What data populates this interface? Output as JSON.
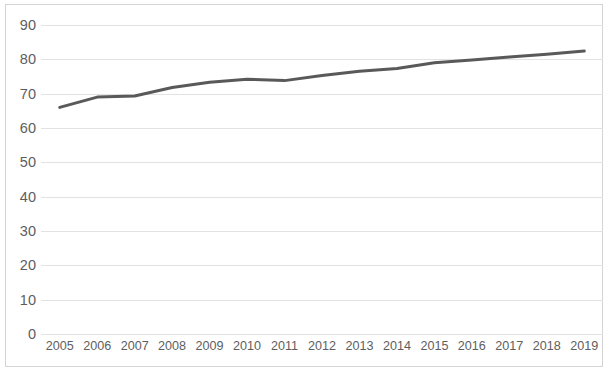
{
  "chart_data": {
    "type": "line",
    "title": "",
    "subtitle": "",
    "xlabel": "",
    "ylabel": "",
    "categories": [
      "2005",
      "2006",
      "2007",
      "2008",
      "2009",
      "2010",
      "2011",
      "2012",
      "2013",
      "2014",
      "2015",
      "2016",
      "2017",
      "2018",
      "2019"
    ],
    "series": [
      {
        "name": "",
        "color": "#595959",
        "values": [
          66,
          69,
          69.3,
          71.8,
          73.3,
          74.2,
          73.8,
          75.3,
          76.5,
          77.3,
          79,
          79.8,
          80.7,
          81.5,
          82.4
        ]
      }
    ],
    "ylim": [
      0,
      90
    ],
    "yticks": [
      0,
      10,
      20,
      30,
      40,
      50,
      60,
      70,
      80,
      90
    ],
    "ytick_labels": [
      "0",
      "10",
      "20",
      "30",
      "40",
      "50",
      "60",
      "70",
      "80",
      "90"
    ],
    "xtick_labels": [
      "2005",
      "2006",
      "2007",
      "2008",
      "2009",
      "2010",
      "2011",
      "2012",
      "2013",
      "2014",
      "2015",
      "2016",
      "2017",
      "2018",
      "2019"
    ],
    "grid": {
      "horizontal": true,
      "vertical": false,
      "color": "#e2e2e2"
    },
    "legend": {
      "visible": false,
      "position": "none",
      "entries": []
    },
    "annotations": [],
    "axis_text_color": "#5e5e5e",
    "plot_border_color": "#d4d4d4",
    "background_color": "#ffffff"
  }
}
